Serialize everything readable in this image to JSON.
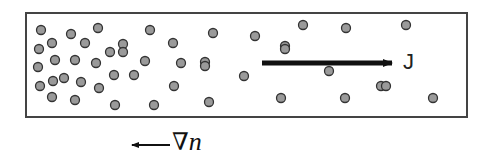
{
  "diagram": {
    "box": {
      "x": 26,
      "y": 13,
      "width": 441,
      "height": 104,
      "stroke": "#444444"
    },
    "particle_style": {
      "radius": 4.5,
      "fill": "#9a9a9a",
      "stroke": "#333333"
    },
    "particles": [
      [
        41,
        30
      ],
      [
        39,
        49
      ],
      [
        52,
        43
      ],
      [
        38,
        67
      ],
      [
        55,
        60
      ],
      [
        40,
        86
      ],
      [
        53,
        81
      ],
      [
        64,
        78
      ],
      [
        52,
        97
      ],
      [
        71,
        34
      ],
      [
        85,
        43
      ],
      [
        75,
        60
      ],
      [
        81,
        82
      ],
      [
        75,
        100
      ],
      [
        98,
        28
      ],
      [
        96,
        63
      ],
      [
        110,
        52
      ],
      [
        99,
        88
      ],
      [
        123,
        44
      ],
      [
        114,
        75
      ],
      [
        123,
        52
      ],
      [
        150,
        30
      ],
      [
        145,
        61
      ],
      [
        134,
        75
      ],
      [
        115,
        105
      ],
      [
        173,
        43
      ],
      [
        181,
        63
      ],
      [
        174,
        86
      ],
      [
        154,
        105
      ],
      [
        205,
        62
      ],
      [
        213,
        33
      ],
      [
        205,
        66
      ],
      [
        209,
        102
      ],
      [
        244,
        76
      ],
      [
        255,
        36
      ],
      [
        285,
        46
      ],
      [
        285,
        49
      ],
      [
        329,
        71
      ],
      [
        281,
        98
      ],
      [
        303,
        25
      ],
      [
        346,
        28
      ],
      [
        406,
        25
      ],
      [
        381,
        86
      ],
      [
        345,
        98
      ],
      [
        433,
        98
      ],
      [
        386,
        86
      ]
    ],
    "flux_arrow": {
      "x1": 262,
      "y1": 63,
      "x2": 392,
      "y2": 63,
      "color": "#111111"
    },
    "flux_label": "J",
    "gradient_arrow": {
      "x1": 170,
      "y1": 145,
      "x2": 132,
      "y2": 145,
      "color": "#111111"
    },
    "gradient_symbol": "∇",
    "gradient_var": "n"
  }
}
